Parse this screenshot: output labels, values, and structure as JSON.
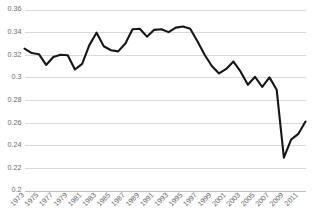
{
  "chart_data": {
    "type": "line",
    "title": "",
    "subtitle": "",
    "xlabel": "",
    "ylabel": "",
    "grid": true,
    "legend": false,
    "legend_position": "none",
    "line_color": "#161616",
    "gridline_color": "#d9d9d9",
    "axis_color": "#bfbfbf",
    "tick_label_color": "#6b6b6b",
    "background_color": "#ffffff",
    "xlim": [
      1973,
      2012
    ],
    "ylim": [
      0.2,
      0.36
    ],
    "ytick_labels": [
      "0.36",
      "0.34",
      "0.32",
      "0.3",
      "0.28",
      "0.26",
      "0.24",
      "0.22",
      "0.2"
    ],
    "ytick_values": [
      0.36,
      0.34,
      0.32,
      0.3,
      0.28,
      0.26,
      0.24,
      0.22,
      0.2
    ],
    "xtick_labels": [
      "1973",
      "1975",
      "1977",
      "1979",
      "1981",
      "1983",
      "1985",
      "1987",
      "1989",
      "1991",
      "1993",
      "1995",
      "1997",
      "1999",
      "2001",
      "2003",
      "2005",
      "2007",
      "2009",
      "2011"
    ],
    "xtick_values": [
      1973,
      1975,
      1977,
      1979,
      1981,
      1983,
      1985,
      1987,
      1989,
      1991,
      1993,
      1995,
      1997,
      1999,
      2001,
      2003,
      2005,
      2007,
      2009,
      2011
    ],
    "x": [
      1973,
      1974,
      1975,
      1976,
      1977,
      1978,
      1979,
      1980,
      1981,
      1982,
      1983,
      1984,
      1985,
      1986,
      1987,
      1988,
      1989,
      1990,
      1991,
      1992,
      1993,
      1994,
      1995,
      1996,
      1997,
      1998,
      1999,
      2000,
      2001,
      2002,
      2003,
      2004,
      2005,
      2006,
      2007,
      2008,
      2009,
      2010,
      2011,
      2012
    ],
    "values": [
      0.3255,
      0.3215,
      0.3205,
      0.311,
      0.318,
      0.32,
      0.3195,
      0.307,
      0.312,
      0.3285,
      0.3395,
      0.3275,
      0.324,
      0.323,
      0.33,
      0.3425,
      0.343,
      0.336,
      0.342,
      0.3425,
      0.34,
      0.344,
      0.345,
      0.343,
      0.332,
      0.32,
      0.31,
      0.3035,
      0.3075,
      0.314,
      0.305,
      0.2935,
      0.3005,
      0.2915,
      0.2845,
      0.284,
      0.288,
      0.293,
      0.2985,
      0.2995
    ],
    "values_tail": [
      0.3,
      0.289,
      0.229,
      0.245,
      0.25,
      0.261
    ],
    "x_tail": [
      2007,
      2008,
      2009,
      2010,
      2011,
      2012
    ],
    "series_name": "value"
  },
  "axes": {
    "y_axis_name": "y-axis",
    "x_axis_name": "x-axis"
  }
}
